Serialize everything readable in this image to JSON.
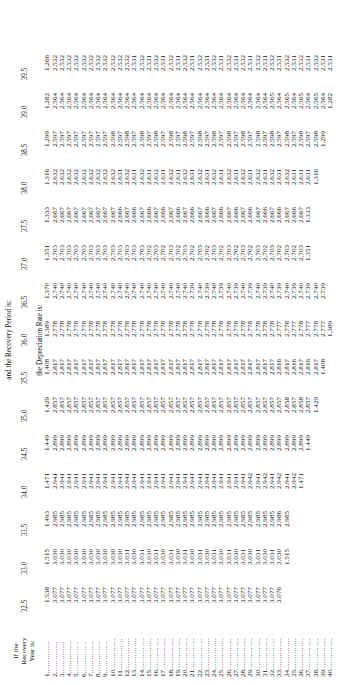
{
  "table": {
    "corner_header": [
      "If the",
      "Recovery",
      "Year is:"
    ],
    "span_header": "and the Recovery Period is:",
    "sub_header": "the Depreciation Rate is:",
    "leader": "..............",
    "columns": [
      "32.5",
      "33.0",
      "33.5",
      "34.0",
      "34.5",
      "35.0",
      "35.5",
      "36.0",
      "36.5",
      "37.0",
      "37.5",
      "38.0",
      "38.5",
      "39.0",
      "39.5"
    ],
    "row_labels": [
      "1",
      "2",
      "3",
      "4",
      "5",
      "6",
      "7",
      "8",
      "9",
      "10",
      "11",
      "12",
      "13",
      "14",
      "15",
      "16",
      "17",
      "18",
      "19",
      "20",
      "21",
      "22",
      "23",
      "24",
      "25",
      "26",
      "27",
      "28",
      "29",
      "30",
      "31",
      "32",
      "33",
      "34",
      "35",
      "36",
      "37",
      "38",
      "39",
      "40"
    ],
    "rows": [
      [
        "1.538",
        "1.515",
        "1.493",
        "1.471",
        "1.449",
        "1.429",
        "1.408",
        "1.389",
        "1.370",
        "1.351",
        "1.333",
        "1.316",
        "1.299",
        "1.282",
        "1.266"
      ],
      [
        "3.077",
        "3.030",
        "2.985",
        "2.941",
        "2.899",
        "2.857",
        "2.817",
        "2.778",
        "2.740",
        "2.703",
        "2.667",
        "2.632",
        "2.597",
        "2.564",
        "2.532"
      ],
      [
        "3.077",
        "3.030",
        "2.985",
        "2.941",
        "2.899",
        "2.857",
        "2.817",
        "2.778",
        "2.740",
        "2.703",
        "2.667",
        "2.632",
        "2.597",
        "2.564",
        "2.532"
      ],
      [
        "3.077",
        "3.030",
        "2.985",
        "2.941",
        "2.899",
        "2.857",
        "2.817",
        "2.778",
        "2.740",
        "2.703",
        "2.667",
        "2.632",
        "2.597",
        "2.564",
        "2.532"
      ],
      [
        "3.077",
        "3.030",
        "2.985",
        "2.941",
        "2.899",
        "2.857",
        "2.817",
        "2.778",
        "2.740",
        "2.703",
        "2.667",
        "2.632",
        "2.597",
        "2.564",
        "2.532"
      ],
      [
        "3.077",
        "3.030",
        "2.985",
        "2.941",
        "2.899",
        "2.857",
        "2.817",
        "2.778",
        "2.740",
        "2.703",
        "2.667",
        "2.632",
        "2.597",
        "2.564",
        "2.532"
      ],
      [
        "3.077",
        "3.030",
        "2.985",
        "2.941",
        "2.899",
        "2.857",
        "2.817",
        "2.778",
        "2.740",
        "2.703",
        "2.667",
        "2.632",
        "2.597",
        "2.564",
        "2.532"
      ],
      [
        "3.077",
        "3.030",
        "2.985",
        "2.941",
        "2.899",
        "2.857",
        "2.817",
        "2.778",
        "2.740",
        "2.703",
        "2.667",
        "2.632",
        "2.597",
        "2.564",
        "2.532"
      ],
      [
        "3.077",
        "3.030",
        "2.985",
        "2.941",
        "2.899",
        "2.857",
        "2.817",
        "2.778",
        "2.740",
        "2.703",
        "2.667",
        "2.632",
        "2.597",
        "2.564",
        "2.532"
      ],
      [
        "3.077",
        "3.030",
        "2.985",
        "2.941",
        "2.899",
        "2.857",
        "2.817",
        "2.778",
        "2.740",
        "2.703",
        "2.667",
        "2.632",
        "2.598",
        "2.564",
        "2.532"
      ],
      [
        "3.077",
        "3.030",
        "2.985",
        "2.941",
        "2.899",
        "2.857",
        "2.817",
        "2.778",
        "2.740",
        "2.703",
        "2.666",
        "2.631",
        "2.597",
        "2.564",
        "2.532"
      ],
      [
        "3.077",
        "3.031",
        "2.985",
        "2.941",
        "2.899",
        "2.857",
        "2.817",
        "2.778",
        "2.740",
        "2.703",
        "2.667",
        "2.632",
        "2.598",
        "2.564",
        "2.532"
      ],
      [
        "3.077",
        "3.030",
        "2.985",
        "2.941",
        "2.899",
        "2.857",
        "2.817",
        "2.778",
        "2.740",
        "2.703",
        "2.666",
        "2.631",
        "2.597",
        "2.564",
        "2.531"
      ],
      [
        "3.077",
        "3.031",
        "2.985",
        "2.941",
        "2.899",
        "2.857",
        "2.817",
        "2.778",
        "2.740",
        "2.703",
        "2.667",
        "2.632",
        "2.598",
        "2.564",
        "2.532"
      ],
      [
        "3.077",
        "3.030",
        "2.985",
        "2.941",
        "2.899",
        "2.857",
        "2.817",
        "2.778",
        "2.740",
        "2.702",
        "2.666",
        "2.631",
        "2.597",
        "2.564",
        "2.531"
      ],
      [
        "3.077",
        "3.031",
        "2.985",
        "2.941",
        "2.899",
        "2.857",
        "2.817",
        "2.778",
        "2.740",
        "2.703",
        "2.667",
        "2.632",
        "2.598",
        "2.564",
        "2.532"
      ],
      [
        "3.077",
        "3.030",
        "2.985",
        "2.941",
        "2.899",
        "2.857",
        "2.817",
        "2.778",
        "2.740",
        "2.702",
        "2.666",
        "2.631",
        "2.597",
        "2.564",
        "2.531"
      ],
      [
        "3.077",
        "3.031",
        "2.985",
        "2.941",
        "2.899",
        "2.857",
        "2.817",
        "2.778",
        "2.740",
        "2.703",
        "2.667",
        "2.632",
        "2.598",
        "2.564",
        "2.532"
      ],
      [
        "3.077",
        "3.030",
        "2.985",
        "2.941",
        "2.899",
        "2.857",
        "2.817",
        "2.778",
        "2.740",
        "2.702",
        "2.666",
        "2.631",
        "2.597",
        "2.564",
        "2.531"
      ],
      [
        "3.077",
        "3.031",
        "2.985",
        "2.941",
        "2.899",
        "2.857",
        "2.817",
        "2.778",
        "2.740",
        "2.703",
        "2.667",
        "2.632",
        "2.598",
        "2.564",
        "2.532"
      ],
      [
        "3.077",
        "3.030",
        "2.985",
        "2.941",
        "2.899",
        "2.857",
        "2.817",
        "2.778",
        "2.739",
        "2.702",
        "2.666",
        "2.631",
        "2.597",
        "2.564",
        "2.531"
      ],
      [
        "3.077",
        "3.031",
        "2.985",
        "2.941",
        "2.899",
        "2.857",
        "2.817",
        "2.778",
        "2.740",
        "2.703",
        "2.667",
        "2.632",
        "2.598",
        "2.564",
        "2.532"
      ],
      [
        "3.077",
        "3.030",
        "2.985",
        "2.941",
        "2.899",
        "2.857",
        "2.817",
        "2.778",
        "2.739",
        "2.702",
        "2.666",
        "2.631",
        "2.597",
        "2.564",
        "2.531"
      ],
      [
        "3.077",
        "3.031",
        "2.985",
        "2.941",
        "2.899",
        "2.857",
        "2.817",
        "2.778",
        "2.740",
        "2.703",
        "2.667",
        "2.632",
        "2.598",
        "2.564",
        "2.532"
      ],
      [
        "3.077",
        "3.030",
        "2.985",
        "2.941",
        "2.899",
        "2.857",
        "2.817",
        "2.778",
        "2.739",
        "2.702",
        "2.666",
        "2.631",
        "2.597",
        "2.564",
        "2.531"
      ],
      [
        "3.077",
        "3.031",
        "2.985",
        "2.941",
        "2.899",
        "2.857",
        "2.817",
        "2.778",
        "2.740",
        "2.703",
        "2.667",
        "2.632",
        "2.598",
        "2.564",
        "2.532"
      ],
      [
        "3.077",
        "3.030",
        "2.985",
        "2.941",
        "2.899",
        "2.857",
        "2.817",
        "2.778",
        "2.739",
        "2.702",
        "2.666",
        "2.631",
        "2.597",
        "2.564",
        "2.531"
      ],
      [
        "3.077",
        "3.031",
        "2.985",
        "2.941",
        "2.899",
        "2.857",
        "2.817",
        "2.778",
        "2.740",
        "2.703",
        "2.667",
        "2.632",
        "2.598",
        "2.564",
        "2.532"
      ],
      [
        "3.077",
        "3.030",
        "2.985",
        "2.942",
        "2.899",
        "2.857",
        "2.817",
        "2.778",
        "2.739",
        "2.702",
        "2.666",
        "2.631",
        "2.597",
        "2.564",
        "2.531"
      ],
      [
        "3.077",
        "3.031",
        "2.985",
        "2.941",
        "2.899",
        "2.857",
        "2.817",
        "2.778",
        "2.740",
        "2.703",
        "2.667",
        "2.632",
        "2.598",
        "2.564",
        "2.532"
      ],
      [
        "3.077",
        "3.030",
        "2.985",
        "2.942",
        "2.899",
        "2.857",
        "2.817",
        "2.778",
        "2.739",
        "2.702",
        "2.666",
        "2.631",
        "2.597",
        "2.564",
        "2.531"
      ],
      [
        "3.077",
        "3.031",
        "2.985",
        "2.941",
        "2.899",
        "2.857",
        "2.817",
        "2.778",
        "2.740",
        "2.703",
        "2.667",
        "2.632",
        "2.598",
        "2.565",
        "2.532"
      ],
      [
        "3.076",
        "3.030",
        "2.986",
        "2.942",
        "2.899",
        "2.857",
        "2.816",
        "2.777",
        "2.739",
        "2.702",
        "2.666",
        "2.631",
        "2.597",
        "2.564",
        "2.531"
      ],
      [
        "",
        "1.515",
        "2.985",
        "2.941",
        "2.899",
        "2.858",
        "2.817",
        "2.778",
        "2.740",
        "2.703",
        "2.667",
        "2.632",
        "2.598",
        "2.565",
        "2.532"
      ],
      [
        "",
        "",
        "",
        "2.942",
        "2.899",
        "2.857",
        "2.816",
        "2.777",
        "2.739",
        "2.702",
        "2.666",
        "2.631",
        "2.597",
        "2.564",
        "2.531"
      ],
      [
        "",
        "",
        "",
        "1.471",
        "2.899",
        "2.858",
        "2.817",
        "2.778",
        "2.740",
        "2.703",
        "2.667",
        "2.631",
        "2.598",
        "2.565",
        "2.532"
      ],
      [
        "",
        "",
        "",
        "",
        "1.449",
        "2.857",
        "2.816",
        "2.777",
        "2.739",
        "1.351",
        "1.333",
        "2.631",
        "2.597",
        "2.564",
        "2.531"
      ],
      [
        "",
        "",
        "",
        "",
        "",
        "1.429",
        "2.817",
        "2.778",
        "2.740",
        "",
        "",
        "1.316",
        "2.598",
        "2.565",
        "2.532"
      ],
      [
        "",
        "",
        "",
        "",
        "",
        "",
        "1.408",
        "2.777",
        "2.739",
        "",
        "",
        "",
        "1.299",
        "2.564",
        "2.531"
      ],
      [
        "",
        "",
        "",
        "",
        "",
        "",
        "",
        "1.389",
        "",
        "",
        "",
        "",
        "",
        "1.282",
        "2.531"
      ]
    ]
  }
}
